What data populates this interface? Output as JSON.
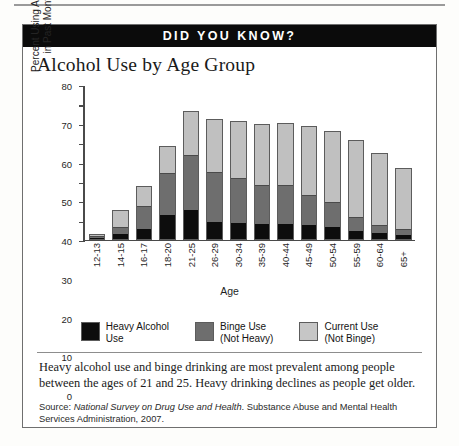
{
  "banner": {
    "label": "DID YOU KNOW?"
  },
  "chart_data": {
    "type": "bar",
    "subtype": "stacked-bar",
    "title": "Alcohol Use by Age Group",
    "xlabel": "Age",
    "ylabel": "Percent Using Alcohol\nin Past Month",
    "ylim": [
      0,
      80
    ],
    "yticks": [
      0,
      10,
      20,
      30,
      40,
      50,
      60,
      70,
      80
    ],
    "grid": false,
    "legend_position": "bottom",
    "categories": [
      "12-13",
      "14-15",
      "16-17",
      "18-20",
      "21-25",
      "26-29",
      "30-34",
      "35-39",
      "40-44",
      "45-49",
      "50-54",
      "55-59",
      "60-64",
      "65+"
    ],
    "series": [
      {
        "name": "Heavy Alcohol\nUse",
        "legend_label": "Heavy Alcohol\nUse",
        "color": "#0d0d0d",
        "values": [
          0.5,
          2.5,
          5,
          12.5,
          15,
          9,
          8,
          7.5,
          7.5,
          7,
          6,
          4,
          3,
          2
        ]
      },
      {
        "name": "Binge Use\n(Not Heavy)",
        "legend_label": "Binge Use\n(Not Heavy)",
        "color": "#6e6e6e",
        "values": [
          1,
          4,
          12.5,
          22.5,
          29.5,
          26.5,
          24,
          21,
          21,
          16,
          13.5,
          7.5,
          4,
          3
        ]
      },
      {
        "name": "Current Use\n(Not Binge)",
        "legend_label": "Current Use\n(Not Binge)",
        "color": "#c0c0c0",
        "values": [
          1.5,
          9,
          10.5,
          14,
          22.5,
          27.5,
          30,
          32,
          32.5,
          36.5,
          37.5,
          40.5,
          38,
          32.5
        ]
      }
    ],
    "totals": [
      3,
      15.5,
      28,
      49,
      67,
      63,
      62,
      60.5,
      61,
      59.5,
      57,
      52,
      45,
      37.5
    ]
  },
  "caption": "Heavy alcohol use and binge drinking are most prevalent among people between the ages of 21 and 25. Heavy drinking declines as people get older.",
  "source": {
    "prefix": "Source: ",
    "italic_title": "National Survey on Drug Use and Health",
    "rest": ". Substance Abuse and Mental Health Services Administration, 2007."
  }
}
